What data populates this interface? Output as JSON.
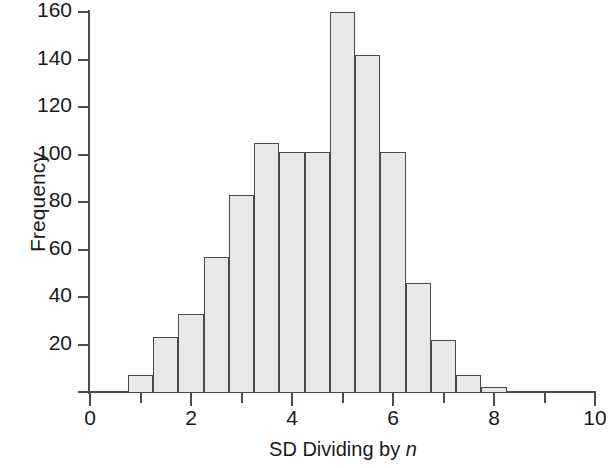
{
  "chart_data": {
    "type": "bar",
    "title": "",
    "subtitle": "",
    "xlabel": "SD Dividing by n",
    "xlabel_italic_part": "n",
    "ylabel": "Frequency",
    "xlim": [
      0,
      10
    ],
    "ylim": [
      0,
      160
    ],
    "grid": false,
    "legend": null,
    "bin_width": 0.5,
    "x_major_ticks": [
      0,
      2,
      4,
      6,
      8,
      10
    ],
    "x_minor_ticks": [
      1,
      3,
      5,
      7,
      9
    ],
    "x_tick_labels": [
      "0",
      "2",
      "4",
      "6",
      "8",
      "10"
    ],
    "y_ticks": [
      0,
      20,
      40,
      60,
      80,
      100,
      120,
      140,
      160
    ],
    "y_tick_labels": [
      "20",
      "40",
      "60",
      "80",
      "100",
      "120",
      "140",
      "160"
    ],
    "bar_fill_color": "#e8e8e8",
    "bar_edge_color": "#4a4a4a",
    "axis_color": "#4d4d4d",
    "bin_edges": [
      0.75,
      1.25,
      1.75,
      2.25,
      2.75,
      3.25,
      3.75,
      4.25,
      4.75,
      5.25,
      5.75,
      6.25,
      6.75,
      7.25,
      7.75,
      8.25
    ],
    "bin_centers": [
      1.0,
      1.5,
      2.0,
      2.5,
      3.0,
      3.5,
      4.0,
      4.5,
      5.0,
      5.5,
      6.0,
      6.5,
      7.0,
      7.5,
      8.0
    ],
    "values": [
      7,
      23,
      33,
      57,
      83,
      105,
      101,
      101,
      160,
      142,
      101,
      46,
      22,
      7,
      2
    ]
  }
}
